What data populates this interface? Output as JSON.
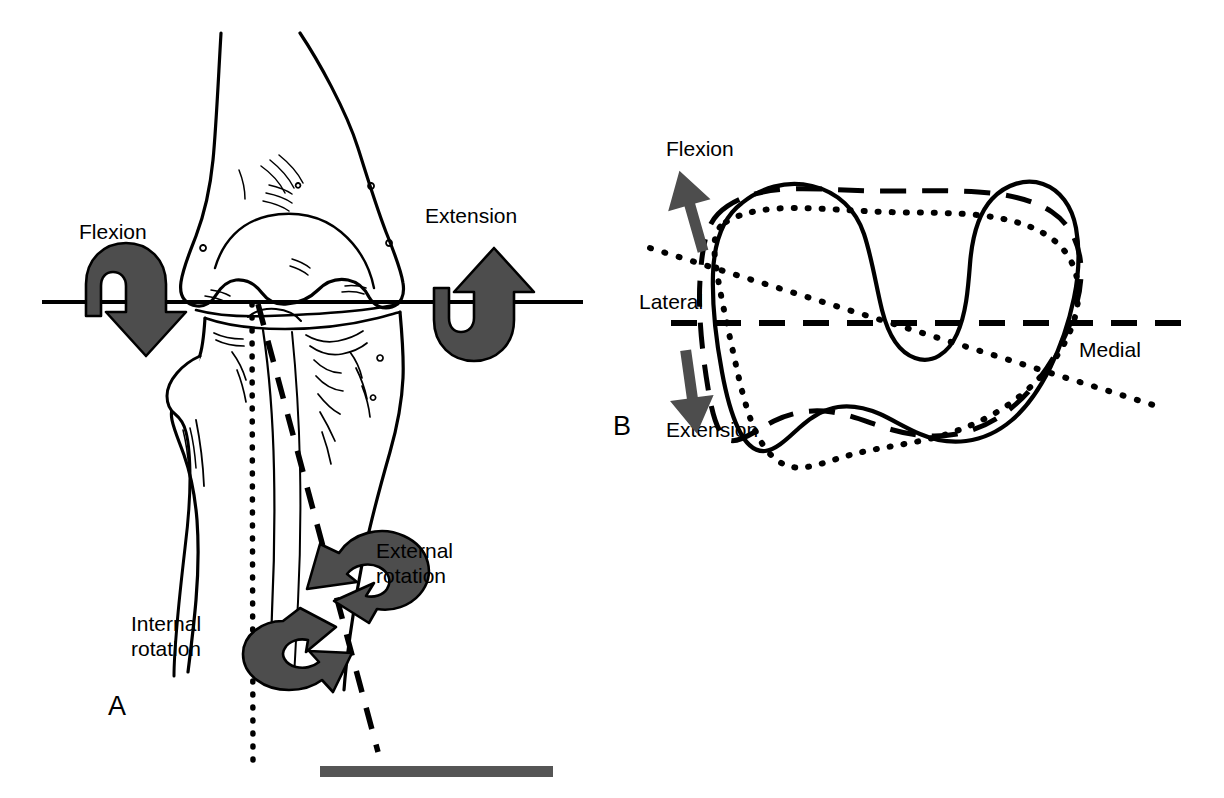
{
  "figure": {
    "title_text": "",
    "background_color": "#ffffff",
    "ink_color": "#000000",
    "arrow_fill_color": "#4d4d4d",
    "scale_bar_color": "#555555"
  },
  "panel_a": {
    "letter": "A",
    "view_description": "anterior view of the knee showing distal femur, proximal tibia and fibula",
    "labels": {
      "flexion": "Flexion",
      "extension": "Extension",
      "external_rotation": "External\nrotation",
      "internal_rotation": "Internal\nrotation"
    },
    "axes": {
      "flexion_extension_axis": "horizontal solid transepicondylar line",
      "internal_rotation_axis": "vertical dotted line",
      "external_rotation_axis": "oblique dashed line"
    },
    "scale_bar": "gray horizontal scale bar"
  },
  "panel_b": {
    "letter": "B",
    "view_description": "superior view of tibial plateau with three overlaid condylar contours",
    "labels": {
      "flexion": "Flexion",
      "extension": "Extension",
      "lateral": "Lateral",
      "medial": "Medial"
    },
    "contours": [
      {
        "name": "solid-contour",
        "style": "solid"
      },
      {
        "name": "dashed-contour",
        "style": "dashed"
      },
      {
        "name": "dotted-contour",
        "style": "dotted"
      }
    ],
    "axes": {
      "medial_lateral_axis": "horizontal dashed line",
      "oblique_axis": "oblique dotted line"
    },
    "arrows": {
      "flexion_arrow": "up arrow",
      "extension_arrow": "down arrow"
    }
  }
}
